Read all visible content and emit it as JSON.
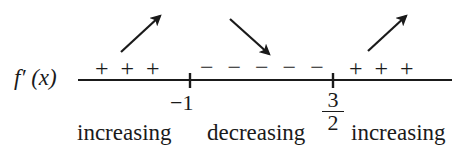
{
  "diagram": {
    "type": "sign-chart",
    "function_label": "f′ (x)",
    "axis": {
      "color": "#1a1a1a",
      "critical_points": [
        {
          "label": "−1",
          "value": -1
        },
        {
          "label_numerator": "3",
          "label_denominator": "2",
          "value": 1.5
        }
      ]
    },
    "intervals": [
      {
        "sign": "+ + +",
        "arrow": "up-right",
        "behavior": "increasing"
      },
      {
        "sign": "− − − − −",
        "arrow": "down-right",
        "behavior": "decreasing"
      },
      {
        "sign": "+ + +",
        "arrow": "up-right",
        "behavior": "increasing"
      }
    ]
  }
}
